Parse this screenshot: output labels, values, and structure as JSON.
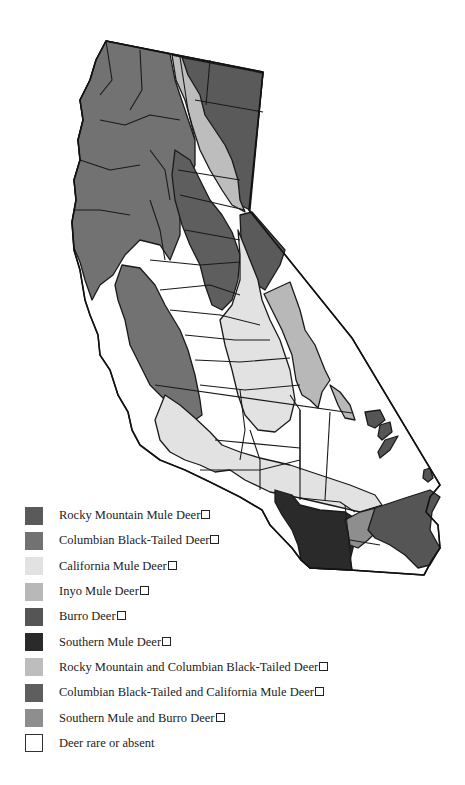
{
  "map": {
    "subject": "Deer distribution in California",
    "colors": {
      "rocky_mountain_mule": "#5a5a5a",
      "columbian_black_tailed": "#727272",
      "california_mule": "#e2e2e2",
      "inyo_mule": "#b8b8b8",
      "burro": "#555555",
      "southern_mule": "#2a2a2a",
      "rocky_columbian": "#bdbdbd",
      "columbian_california": "#5e5e5e",
      "southern_burro": "#8e8e8e",
      "rare_absent": "#ffffff"
    }
  },
  "legend": {
    "items": [
      {
        "key": "rocky_mountain_mule",
        "label": "Rocky Mountain Mule Deer",
        "color": "#5a5a5a",
        "trailing_box": true
      },
      {
        "key": "columbian_black_tailed",
        "label": "Columbian Black-Tailed Deer",
        "color": "#727272",
        "trailing_box": true
      },
      {
        "key": "california_mule",
        "label": "California Mule Deer",
        "color": "#e2e2e2",
        "trailing_box": true
      },
      {
        "key": "inyo_mule",
        "label": "Inyo Mule Deer",
        "color": "#b8b8b8",
        "trailing_box": true
      },
      {
        "key": "burro",
        "label": "Burro Deer",
        "color": "#555555",
        "trailing_box": true
      },
      {
        "key": "southern_mule",
        "label": "Southern Mule Deer",
        "color": "#2a2a2a",
        "trailing_box": true
      },
      {
        "key": "rocky_columbian",
        "label": "Rocky Mountain and Columbian Black-Tailed Deer",
        "color": "#bdbdbd",
        "trailing_box": true
      },
      {
        "key": "columbian_california",
        "label": "Columbian Black-Tailed and California Mule Deer",
        "color": "#5e5e5e",
        "trailing_box": true
      },
      {
        "key": "southern_burro",
        "label": "Southern Mule and Burro Deer",
        "color": "#8e8e8e",
        "trailing_box": true
      },
      {
        "key": "rare_absent",
        "label": "Deer rare or absent",
        "color": "#ffffff",
        "trailing_box": false
      }
    ]
  }
}
